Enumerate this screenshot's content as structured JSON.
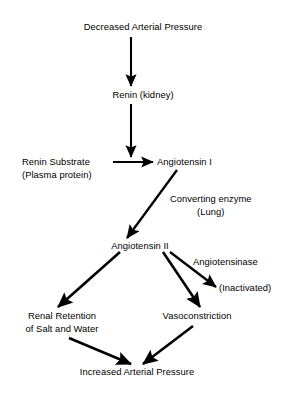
{
  "diagram": {
    "background_color": "#ffffff",
    "stroke_color": "#000000",
    "text_color": "#000000",
    "nodes": [
      {
        "id": "decreased-arterial-pressure",
        "label": "Decreased Arterial Pressure"
      },
      {
        "id": "renin-kidney",
        "label": "Renin (kidney)"
      },
      {
        "id": "renin-substrate",
        "label_line1": "Renin Substrate",
        "label_line2": "(Plasma protein)"
      },
      {
        "id": "angiotensin-i",
        "label": "Angiotensin I"
      },
      {
        "id": "converting-enzyme",
        "label_line1": "Converting enzyme",
        "label_line2": "(Lung)"
      },
      {
        "id": "angiotensin-ii",
        "label": "Angiotensin II"
      },
      {
        "id": "angiotensinase",
        "label": "Angiotensinase"
      },
      {
        "id": "inactivated",
        "label": "(Inactivated)"
      },
      {
        "id": "renal-retention",
        "label_line1": "Renal Retention",
        "label_line2": "of Salt and Water"
      },
      {
        "id": "vasoconstriction",
        "label": "Vasoconstriction"
      },
      {
        "id": "increased-arterial-pressure",
        "label": "Increased Arterial Pressure"
      }
    ],
    "edges": [
      {
        "from": "decreased-arterial-pressure",
        "to": "renin-kidney"
      },
      {
        "from": "renin-kidney",
        "to": "angiotensin-i"
      },
      {
        "from": "renin-substrate",
        "to": "angiotensin-i"
      },
      {
        "from": "angiotensin-i",
        "to": "angiotensin-ii",
        "label": "Converting enzyme (Lung)"
      },
      {
        "from": "angiotensin-ii",
        "to": "inactivated",
        "label": "Angiotensinase"
      },
      {
        "from": "angiotensin-ii",
        "to": "renal-retention"
      },
      {
        "from": "angiotensin-ii",
        "to": "vasoconstriction"
      },
      {
        "from": "renal-retention",
        "to": "increased-arterial-pressure"
      },
      {
        "from": "vasoconstriction",
        "to": "increased-arterial-pressure"
      }
    ]
  }
}
